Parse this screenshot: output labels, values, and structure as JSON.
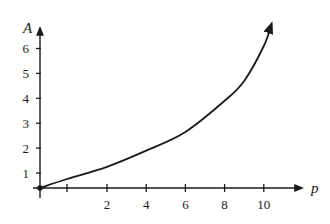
{
  "chart_data": {
    "type": "line",
    "title": "",
    "xlabel": "p",
    "ylabel": "A",
    "x_ticks": [
      2,
      4,
      6,
      8,
      10
    ],
    "x_tick_labels": [
      "2",
      "4",
      "6",
      "8",
      "10"
    ],
    "x_minor_unlabeled_tick": 1,
    "y_ticks": [
      1,
      2,
      3,
      4,
      5,
      6
    ],
    "y_tick_labels": [
      "1",
      "2",
      "3",
      "4",
      "5",
      "6"
    ],
    "xlim": [
      0,
      11
    ],
    "ylim": [
      0,
      7
    ],
    "grid": false,
    "legend": null,
    "origin_marker": true,
    "curve_end_arrow": true,
    "series": [
      {
        "name": "A(p)",
        "x": [
          0,
          1,
          2,
          4,
          6,
          8,
          9,
          10,
          10.4
        ],
        "y": [
          0,
          0.6,
          1.25,
          1.9,
          2.65,
          3.9,
          4.7,
          6.1,
          7.0
        ]
      }
    ],
    "colors": {
      "ink": "#1a1a1a",
      "background": "#ffffff"
    }
  }
}
